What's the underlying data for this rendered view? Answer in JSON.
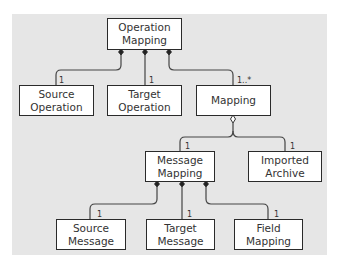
{
  "diagram": {
    "background_color": "#e6e6e6",
    "nodes": [
      {
        "id": "operation_mapping",
        "line1": "Operation",
        "line2": "Mapping"
      },
      {
        "id": "source_operation",
        "line1": "Source",
        "line2": "Operation"
      },
      {
        "id": "target_operation",
        "line1": "Target",
        "line2": "Operation"
      },
      {
        "id": "mapping",
        "line1": "Mapping",
        "line2": ""
      },
      {
        "id": "message_mapping",
        "line1": "Message",
        "line2": "Mapping"
      },
      {
        "id": "imported_archive",
        "line1": "Imported",
        "line2": "Archive"
      },
      {
        "id": "source_message",
        "line1": "Source",
        "line2": "Message"
      },
      {
        "id": "target_message",
        "line1": "Target",
        "line2": "Message"
      },
      {
        "id": "field_mapping",
        "line1": "Field",
        "line2": "Mapping"
      }
    ],
    "edges": [
      {
        "from": "operation_mapping",
        "to": "source_operation",
        "type": "composition",
        "multiplicity": "1"
      },
      {
        "from": "operation_mapping",
        "to": "target_operation",
        "type": "composition",
        "multiplicity": "1"
      },
      {
        "from": "operation_mapping",
        "to": "mapping",
        "type": "composition",
        "multiplicity": "1..*"
      },
      {
        "from": "mapping",
        "to": "message_mapping",
        "type": "aggregation",
        "multiplicity": "1"
      },
      {
        "from": "mapping",
        "to": "imported_archive",
        "type": "aggregation",
        "multiplicity": "1"
      },
      {
        "from": "message_mapping",
        "to": "source_message",
        "type": "composition",
        "multiplicity": "1"
      },
      {
        "from": "message_mapping",
        "to": "target_message",
        "type": "composition",
        "multiplicity": "1"
      },
      {
        "from": "message_mapping",
        "to": "field_mapping",
        "type": "composition",
        "multiplicity": "1"
      }
    ]
  }
}
